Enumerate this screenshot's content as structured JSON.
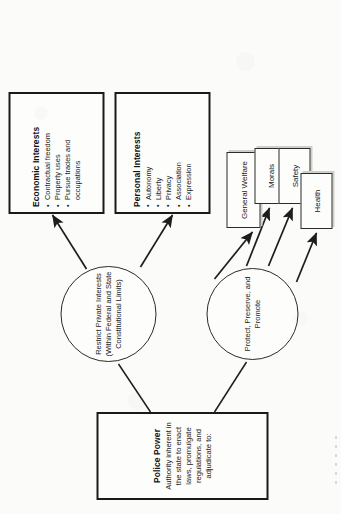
{
  "diagram": {
    "type": "flowchart",
    "orientation": "page-rotated-90-ccw",
    "colors": {
      "page_background": "#fbfbfa",
      "box_border": "#1a1a1a",
      "circle_border": "#2a2a2a",
      "text": "#1b1b1b",
      "shadow": "#cfcfca"
    },
    "root": {
      "title": "Police Power",
      "description": "Authority inherent in the state to enact laws, promulgate regulations, and adjudicate to:"
    },
    "branches": [
      {
        "id": "restrict",
        "hub_lines": [
          "Restrict",
          "Private Interests",
          "(Within Federal and",
          "State Constitutional",
          "Limits)"
        ],
        "hub_text": "Restrict Private Interests (Within Federal and State Constitutional Limits)",
        "outputs": [
          {
            "id": "economic-interests",
            "title": "Economic Interests",
            "items": [
              "Contractual freedom",
              "Property uses",
              "Pursue trades and occupations"
            ]
          },
          {
            "id": "personal-interests",
            "title": "Personal Interests",
            "items": [
              "Autonomy",
              "Liberty",
              "Privacy",
              "Association",
              "Expression"
            ]
          }
        ]
      },
      {
        "id": "protect",
        "hub_lines": [
          "Protect,",
          "Preserve,",
          "and Promote"
        ],
        "hub_text": "Protect, Preserve, and Promote",
        "outputs": [
          {
            "id": "general-welfare",
            "title": "General Welfare",
            "items": []
          },
          {
            "id": "morals",
            "title": "Morals",
            "items": []
          },
          {
            "id": "safety",
            "title": "Safety",
            "items": []
          },
          {
            "id": "health",
            "title": "Health",
            "items": []
          }
        ]
      }
    ]
  }
}
